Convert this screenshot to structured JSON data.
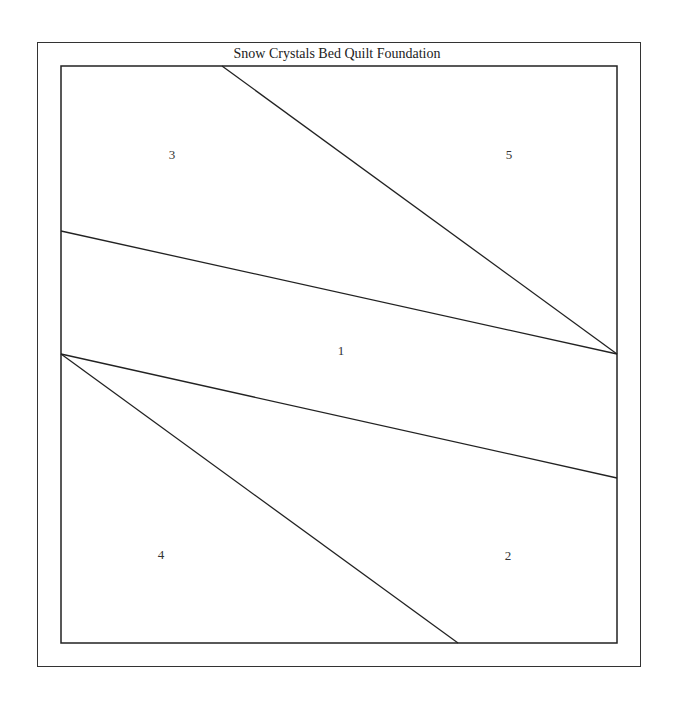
{
  "title": "Snow Crystals Bed Quilt Foundation",
  "colors": {
    "line": "#222222",
    "background": "#ffffff",
    "text": "#222222"
  },
  "outer_frame": {
    "x": 37,
    "y": 42,
    "width": 604,
    "height": 625
  },
  "inner_block": {
    "x": 61,
    "y": 66,
    "width": 556,
    "height": 577
  },
  "seams": [
    {
      "x1": 222,
      "y1": 66,
      "x2": 617,
      "y2": 354
    },
    {
      "x1": 61,
      "y1": 231,
      "x2": 617,
      "y2": 354
    },
    {
      "x1": 61,
      "y1": 354,
      "x2": 617,
      "y2": 478
    },
    {
      "x1": 61,
      "y1": 354,
      "x2": 458,
      "y2": 643
    }
  ],
  "pieces": [
    {
      "number": "3",
      "x": 172,
      "y": 155
    },
    {
      "number": "5",
      "x": 509,
      "y": 155
    },
    {
      "number": "1",
      "x": 341,
      "y": 351
    },
    {
      "number": "4",
      "x": 161,
      "y": 555
    },
    {
      "number": "2",
      "x": 508,
      "y": 556
    }
  ]
}
